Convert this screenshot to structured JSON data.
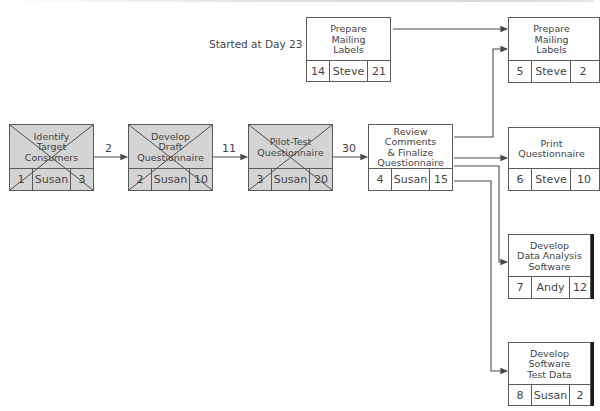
{
  "annotation": "Started at Day 23",
  "lags": [
    {
      "id": "lag-1-2",
      "value": "2"
    },
    {
      "id": "lag-2-3",
      "value": "11"
    },
    {
      "id": "lag-3-4",
      "value": "30"
    }
  ],
  "nodes": [
    {
      "id": 1,
      "title": "Identify\nTarget\nConsumers",
      "owner": "Susan",
      "number": "1",
      "duration": "3",
      "completed": true
    },
    {
      "id": 2,
      "title": "Develop\nDraft\nQuestionnaire",
      "owner": "Susan",
      "number": "2",
      "duration": "10",
      "completed": true
    },
    {
      "id": 3,
      "title": "Pilot-Test\nQuestionnaire",
      "owner": "Susan",
      "number": "3",
      "duration": "20",
      "completed": true
    },
    {
      "id": 4,
      "title": "Review Comments\n& Finalize\nQuestionnaire",
      "owner": "Susan",
      "number": "4",
      "duration": "15",
      "completed": false
    },
    {
      "id": 14,
      "title": "Prepare\nMailing\nLabels",
      "owner": "Steve",
      "number": "14",
      "duration": "21",
      "completed": false
    },
    {
      "id": 5,
      "title": "Prepare\nMailing\nLabels",
      "owner": "Steve",
      "number": "5",
      "duration": "2",
      "completed": false
    },
    {
      "id": 6,
      "title": "Print\nQuestionnaire",
      "owner": "Steve",
      "number": "6",
      "duration": "10",
      "completed": false
    },
    {
      "id": 7,
      "title": "Develop\nData Analysis\nSoftware",
      "owner": "Andy",
      "number": "7",
      "duration": "12",
      "completed": false
    },
    {
      "id": 8,
      "title": "Develop\nSoftware\nTest Data",
      "owner": "Susan",
      "number": "8",
      "duration": "2",
      "completed": false
    }
  ],
  "colors": {
    "completed_fill": "#d4d4d4",
    "pending_fill": "#ffffff",
    "line": "#4a4a4a"
  }
}
